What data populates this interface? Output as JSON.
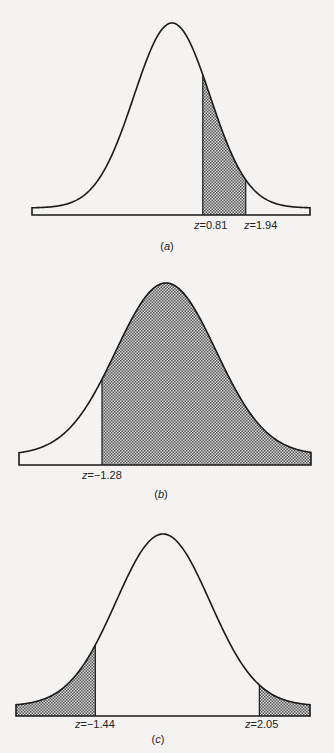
{
  "chart_data": [
    {
      "type": "area",
      "title": "(a)",
      "description": "Standard normal curve, shaded area between z = 0.81 and z = 1.94",
      "shaded_regions": [
        {
          "from": 0.81,
          "to": 1.94
        }
      ],
      "annotations": [
        "z = 0.81",
        "z = 1.94"
      ],
      "xlim": [
        -3.5,
        3.5
      ],
      "grid": false
    },
    {
      "type": "area",
      "title": "(b)",
      "description": "Standard normal curve, shaded area to the right of z = -1.28",
      "shaded_regions": [
        {
          "from": -1.28,
          "to": "inf"
        }
      ],
      "annotations": [
        "z = -1.28"
      ],
      "xlim": [
        -3.5,
        3.5
      ],
      "grid": false
    },
    {
      "type": "area",
      "title": "(c)",
      "description": "Standard normal curve, shaded tails left of z = -1.44 and right of z = 2.05",
      "shaded_regions": [
        {
          "from": "-inf",
          "to": -1.44
        },
        {
          "from": 2.05,
          "to": "inf"
        }
      ],
      "annotations": [
        "z = -1.44",
        "z = 2.05"
      ],
      "xlim": [
        -3.5,
        3.5
      ],
      "grid": false
    }
  ],
  "panels": {
    "a": {
      "caption": "(a)",
      "labels": [
        "0.81",
        "1.94"
      ]
    },
    "b": {
      "caption": "(b)",
      "labels": [
        "−1.28"
      ]
    },
    "c": {
      "caption": "(c)",
      "labels": [
        "−1.44",
        "2.05"
      ]
    }
  },
  "z_prefix": "z",
  "eq": " = ",
  "colors": {
    "line": "#1a1a1a",
    "hatch": "#555555",
    "background": "#f4f3f1"
  }
}
